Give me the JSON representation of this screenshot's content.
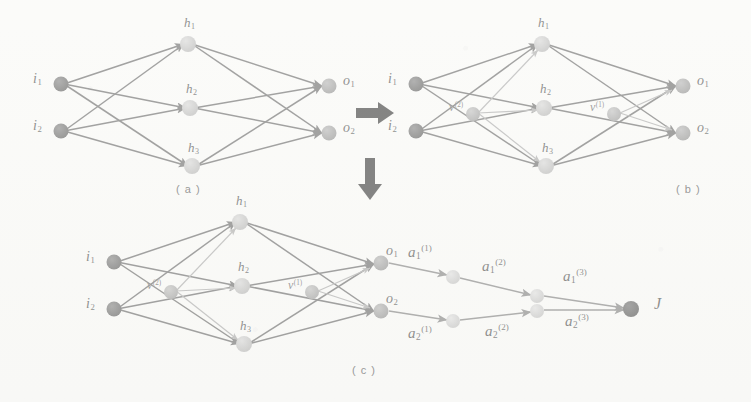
{
  "figure": {
    "captions": [
      {
        "id": "a",
        "text": "( a )"
      },
      {
        "id": "b",
        "text": "( b )"
      },
      {
        "id": "c",
        "text": "( c )"
      }
    ],
    "colors": {
      "input_node": "#4a4a4a",
      "hidden_node": "#b4b4b4",
      "output_node": "#8c8c8c",
      "v_node": "#9a9a9a",
      "a_node": "#c2c2c2",
      "final_node": "#3c3c3c",
      "edge": "#4f4f4f",
      "edge_light": "#9b9b9b",
      "arrow_black": "#1a1a1a",
      "paper": "#fbfbfa"
    }
  },
  "panel_a": {
    "caption": "( a )",
    "inputs": [
      {
        "name": "i1",
        "base": "i",
        "sub": "1"
      },
      {
        "name": "i2",
        "base": "i",
        "sub": "2"
      }
    ],
    "hidden": [
      {
        "name": "h1",
        "base": "h",
        "sub": "1"
      },
      {
        "name": "h2",
        "base": "h",
        "sub": "2"
      },
      {
        "name": "h3",
        "base": "h",
        "sub": "3"
      }
    ],
    "outputs": [
      {
        "name": "o1",
        "base": "o",
        "sub": "1"
      },
      {
        "name": "o2",
        "base": "o",
        "sub": "2"
      }
    ]
  },
  "panel_b": {
    "caption": "( b )",
    "inputs": [
      {
        "name": "i1",
        "base": "i",
        "sub": "1"
      },
      {
        "name": "i2",
        "base": "i",
        "sub": "2"
      }
    ],
    "hidden": [
      {
        "name": "h1",
        "base": "h",
        "sub": "1"
      },
      {
        "name": "h2",
        "base": "h",
        "sub": "2"
      },
      {
        "name": "h3",
        "base": "h",
        "sub": "3"
      }
    ],
    "outputs": [
      {
        "name": "o1",
        "base": "o",
        "sub": "1"
      },
      {
        "name": "o2",
        "base": "o",
        "sub": "2"
      }
    ],
    "v_nodes": [
      {
        "name": "v2",
        "base": "v",
        "sup": "(2)"
      },
      {
        "name": "v1",
        "base": "v",
        "sup": "(1)"
      }
    ]
  },
  "panel_c": {
    "caption": "( c )",
    "inputs": [
      {
        "name": "i1",
        "base": "i",
        "sub": "1"
      },
      {
        "name": "i2",
        "base": "i",
        "sub": "2"
      }
    ],
    "hidden": [
      {
        "name": "h1",
        "base": "h",
        "sub": "1"
      },
      {
        "name": "h2",
        "base": "h",
        "sub": "2"
      },
      {
        "name": "h3",
        "base": "h",
        "sub": "3"
      }
    ],
    "outputs": [
      {
        "name": "o1",
        "base": "o",
        "sub": "1"
      },
      {
        "name": "o2",
        "base": "o",
        "sub": "2"
      }
    ],
    "v_nodes": [
      {
        "name": "v2",
        "base": "v",
        "sup": "(2)"
      },
      {
        "name": "v1",
        "base": "v",
        "sup": "(1)"
      }
    ],
    "chain_top": [
      {
        "name": "a1_1",
        "base": "a",
        "sub": "1",
        "sup": "(1)"
      },
      {
        "name": "a1_2",
        "base": "a",
        "sub": "1",
        "sup": "(2)"
      },
      {
        "name": "a1_3",
        "base": "a",
        "sub": "1",
        "sup": "(3)"
      }
    ],
    "chain_bottom": [
      {
        "name": "a2_1",
        "base": "a",
        "sub": "2",
        "sup": "(1)"
      },
      {
        "name": "a2_2",
        "base": "a",
        "sub": "2",
        "sup": "(2)"
      },
      {
        "name": "a2_3",
        "base": "a",
        "sub": "2",
        "sup": "(3)"
      }
    ],
    "final": {
      "name": "J",
      "base": "J"
    }
  },
  "flow_arrows": [
    {
      "name": "arrow-a-to-b",
      "direction": "right",
      "glyph": "➡"
    },
    {
      "name": "arrow-b-to-c",
      "direction": "down",
      "glyph": "⬇"
    }
  ]
}
